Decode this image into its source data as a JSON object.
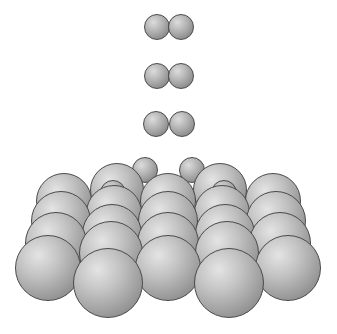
{
  "diagram": {
    "incoming_molecules": [
      {
        "atoms": [
          {
            "x": 157,
            "y": 27,
            "r": 13
          },
          {
            "x": 181,
            "y": 27,
            "r": 13
          }
        ]
      },
      {
        "atoms": [
          {
            "x": 157,
            "y": 76,
            "r": 13
          },
          {
            "x": 181,
            "y": 76,
            "r": 13
          }
        ]
      },
      {
        "atoms": [
          {
            "x": 156,
            "y": 124,
            "r": 13
          },
          {
            "x": 182,
            "y": 124,
            "r": 13
          }
        ]
      }
    ],
    "surface_atoms": [
      {
        "x": 64,
        "y": 201,
        "r": 28,
        "col": 1,
        "row": 1
      },
      {
        "x": 168,
        "y": 201,
        "r": 28,
        "col": 3,
        "row": 1
      },
      {
        "x": 273,
        "y": 201,
        "r": 28,
        "col": 5,
        "row": 1
      },
      {
        "x": 117,
        "y": 190,
        "r": 27,
        "col": 2,
        "row": 1
      },
      {
        "x": 220,
        "y": 190,
        "r": 27,
        "col": 4,
        "row": 1
      },
      {
        "x": 61,
        "y": 221,
        "r": 30,
        "col": 1,
        "row": 2
      },
      {
        "x": 168,
        "y": 221,
        "r": 30,
        "col": 3,
        "row": 2
      },
      {
        "x": 276,
        "y": 221,
        "r": 30,
        "col": 5,
        "row": 2
      },
      {
        "x": 114,
        "y": 213,
        "r": 28,
        "col": 2,
        "row": 2
      },
      {
        "x": 222,
        "y": 213,
        "r": 28,
        "col": 4,
        "row": 2
      },
      {
        "x": 56,
        "y": 243,
        "r": 31,
        "col": 1,
        "row": 3
      },
      {
        "x": 168,
        "y": 243,
        "r": 31,
        "col": 3,
        "row": 3
      },
      {
        "x": 280,
        "y": 243,
        "r": 31,
        "col": 5,
        "row": 3
      },
      {
        "x": 112,
        "y": 234,
        "r": 30,
        "col": 2,
        "row": 3
      },
      {
        "x": 225,
        "y": 234,
        "r": 30,
        "col": 4,
        "row": 3
      },
      {
        "x": 111,
        "y": 253,
        "r": 32,
        "col": 2,
        "row": 4
      },
      {
        "x": 227,
        "y": 253,
        "r": 32,
        "col": 4,
        "row": 4
      },
      {
        "x": 48,
        "y": 268,
        "r": 33,
        "col": 1,
        "row": 5
      },
      {
        "x": 168,
        "y": 268,
        "r": 33,
        "col": 3,
        "row": 5
      },
      {
        "x": 288,
        "y": 268,
        "r": 33,
        "col": 5,
        "row": 5
      },
      {
        "x": 108,
        "y": 283,
        "r": 35,
        "col": 2,
        "row": 6
      },
      {
        "x": 229,
        "y": 283,
        "r": 35,
        "col": 4,
        "row": 6
      }
    ],
    "adsorbed_atoms": [
      {
        "x": 145,
        "y": 170,
        "r": 13
      },
      {
        "x": 192,
        "y": 170,
        "r": 13
      },
      {
        "x": 113,
        "y": 193,
        "r": 13
      },
      {
        "x": 224,
        "y": 193,
        "r": 13
      }
    ]
  }
}
